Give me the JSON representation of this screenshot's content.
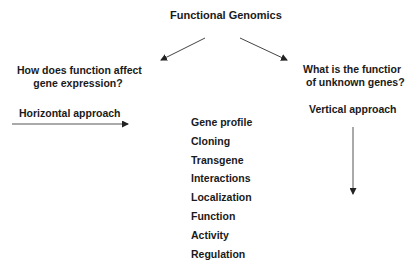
{
  "title": "Functional Genomics",
  "left_branch": {
    "question_line1": "How does function affect",
    "question_line2": "gene expression?",
    "approach": "Horizontal approach"
  },
  "right_branch": {
    "question_line1": "What is the functior",
    "question_line2": "of unknown genes?",
    "approach": "Vertical approach"
  },
  "center_list": [
    "Gene profile",
    "Cloning",
    "Transgene",
    "Interactions",
    "Localization",
    "Function",
    "Activity",
    "Regulation"
  ],
  "colors": {
    "text": "#1a1a1a",
    "arrow": "#333333",
    "background": "#ffffff"
  }
}
